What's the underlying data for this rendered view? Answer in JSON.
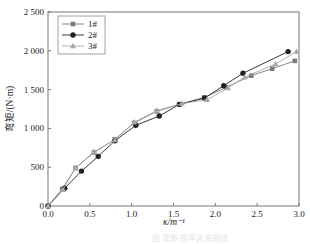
{
  "chart_data": {
    "type": "line",
    "title": "",
    "xlabel": "κ/m⁻¹",
    "ylabel": "弯矩/(N·m)",
    "xlim": [
      0,
      3.0
    ],
    "ylim": [
      0,
      2500
    ],
    "x_ticks": [
      "0.0",
      "0.5",
      "1.0",
      "1.5",
      "2.0",
      "2.5",
      "3.0"
    ],
    "y_ticks": [
      "0",
      "500",
      "1 000",
      "1 500",
      "2 000",
      "2 500"
    ],
    "grid": false,
    "legend_position": "upper-left",
    "series": [
      {
        "name": "1#",
        "marker": "square",
        "color": "#7a7a7a",
        "x": [
          0,
          0.17,
          0.33,
          0.55,
          0.8,
          1.03,
          1.3,
          1.57,
          1.87,
          2.13,
          2.43,
          2.68,
          2.95
        ],
        "values": [
          0,
          220,
          490,
          690,
          860,
          1070,
          1220,
          1310,
          1400,
          1530,
          1680,
          1770,
          1870
        ]
      },
      {
        "name": "2#",
        "marker": "circle",
        "color": "#222222",
        "x": [
          0,
          0.2,
          0.4,
          0.6,
          0.8,
          1.05,
          1.33,
          1.57,
          1.87,
          2.1,
          2.33,
          2.87
        ],
        "values": [
          0,
          230,
          450,
          640,
          840,
          1040,
          1160,
          1310,
          1390,
          1550,
          1710,
          1990
        ]
      },
      {
        "name": "3#",
        "marker": "triangle",
        "color": "#a8a8a8",
        "x": [
          0,
          0.18,
          0.33,
          0.55,
          0.8,
          1.03,
          1.3,
          1.6,
          1.9,
          2.15,
          2.35,
          2.72,
          2.97
        ],
        "values": [
          0,
          210,
          490,
          700,
          850,
          1080,
          1230,
          1320,
          1370,
          1520,
          1660,
          1830,
          1990
        ]
      }
    ]
  },
  "caption": "图 弯矩-曲率关系曲线"
}
